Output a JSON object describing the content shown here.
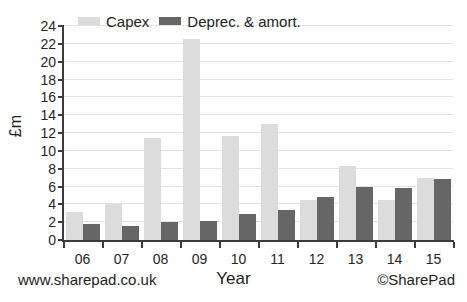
{
  "chart_data": {
    "type": "bar",
    "title": "",
    "xlabel": "Year",
    "ylabel": "£m",
    "categories": [
      "06",
      "07",
      "08",
      "09",
      "10",
      "11",
      "12",
      "13",
      "14",
      "15"
    ],
    "series": [
      {
        "name": "Capex",
        "color": "#dcdcdc",
        "values": [
          3.1,
          4.0,
          11.4,
          22.5,
          11.7,
          13.0,
          4.5,
          8.3,
          4.5,
          7.0
        ]
      },
      {
        "name": "Deprec. & amort.",
        "color": "#666666",
        "values": [
          1.8,
          1.6,
          2.0,
          2.1,
          2.9,
          3.4,
          4.8,
          6.0,
          5.8,
          6.8
        ]
      }
    ],
    "ylim": [
      0,
      24
    ],
    "yticks": [
      0,
      2,
      4,
      6,
      8,
      10,
      12,
      14,
      16,
      18,
      20,
      22,
      24
    ],
    "ytick_labels": [
      "0",
      "2",
      "4",
      "6",
      "8",
      "10",
      "12",
      "14",
      "16",
      "18",
      "20",
      "22",
      "24"
    ],
    "grid": true,
    "grid_axis": "y",
    "legend_position": "top-left"
  },
  "legend": {
    "entries": [
      {
        "label": "Capex",
        "color": "#dcdcdc"
      },
      {
        "label": "Deprec. & amort.",
        "color": "#666666"
      }
    ]
  },
  "footer": {
    "left": "www.sharepad.co.uk",
    "right": "©SharePad"
  }
}
